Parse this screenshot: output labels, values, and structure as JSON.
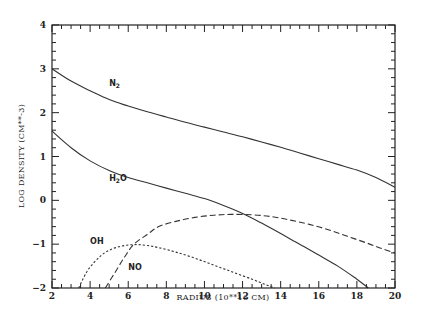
{
  "chart_data": {
    "type": "line",
    "title": "",
    "xlabel": "RADIUS (10**16 CM)",
    "ylabel": "LOG DENSITY (CM**-3)",
    "xlim": [
      2,
      20
    ],
    "ylim": [
      -2,
      4
    ],
    "x_major_ticks": [
      2,
      4,
      6,
      8,
      10,
      12,
      14,
      16,
      18,
      20
    ],
    "x_tick_labels": [
      "2",
      "4",
      "6",
      "8",
      "10",
      "12",
      "14",
      "16",
      "18",
      "20"
    ],
    "x_minor_step": 0.5,
    "y_major_ticks": [
      -2,
      -1,
      0,
      1,
      2,
      3,
      4
    ],
    "y_tick_labels": [
      "-2",
      "-1",
      "0",
      "1",
      "2",
      "3",
      "4"
    ],
    "y_minor_step": 0.2,
    "grid": false,
    "legend": "inline-labels",
    "series": [
      {
        "name": "N2",
        "label": "N",
        "label_sub": "2",
        "label_suffix": "",
        "style": "solid",
        "label_at": [
          5.0,
          2.6
        ],
        "x": [
          2,
          3,
          4,
          5,
          6,
          7,
          8,
          9,
          10,
          11,
          12,
          13,
          14,
          15,
          16,
          17,
          18,
          19,
          20
        ],
        "y": [
          3.0,
          2.72,
          2.5,
          2.3,
          2.15,
          2.02,
          1.9,
          1.78,
          1.67,
          1.56,
          1.45,
          1.33,
          1.21,
          1.08,
          0.95,
          0.82,
          0.69,
          0.52,
          0.3
        ]
      },
      {
        "name": "H2O",
        "label": "H",
        "label_sub": "2",
        "label_suffix": "O",
        "style": "solid",
        "label_at": [
          5.0,
          0.45
        ],
        "x": [
          2,
          3,
          4,
          5,
          6,
          7,
          8,
          9,
          10,
          11,
          12,
          13,
          14,
          15,
          16,
          17,
          18,
          18.6
        ],
        "y": [
          1.58,
          1.2,
          0.9,
          0.68,
          0.52,
          0.4,
          0.28,
          0.16,
          0.04,
          -0.12,
          -0.3,
          -0.52,
          -0.76,
          -1.0,
          -1.25,
          -1.5,
          -1.8,
          -2.0
        ]
      },
      {
        "name": "NO",
        "label": "NO",
        "label_sub": "",
        "label_suffix": "",
        "style": "dashed",
        "label_at": [
          6.0,
          -1.6
        ],
        "x": [
          4.8,
          5.3,
          5.8,
          6.3,
          7.0,
          7.6,
          8.5,
          9.5,
          10.5,
          11.4,
          12.5,
          13.5,
          14.5,
          15.5,
          16.5,
          17.5,
          18.5,
          19.3,
          20
        ],
        "y": [
          -2.0,
          -1.65,
          -1.3,
          -1.0,
          -0.78,
          -0.6,
          -0.48,
          -0.39,
          -0.34,
          -0.32,
          -0.33,
          -0.37,
          -0.45,
          -0.55,
          -0.67,
          -0.82,
          -0.97,
          -1.1,
          -1.2
        ]
      },
      {
        "name": "OH",
        "label": "OH",
        "label_sub": "",
        "label_suffix": "",
        "style": "dotted",
        "label_at": [
          4.0,
          -1.0
        ],
        "x": [
          3.4,
          3.8,
          4.2,
          4.6,
          5.0,
          5.5,
          6.0,
          6.5,
          7.0,
          7.6,
          8.5,
          9.5,
          10.5,
          11.5,
          12.5,
          13.2,
          13.7
        ],
        "y": [
          -2.0,
          -1.65,
          -1.42,
          -1.25,
          -1.14,
          -1.06,
          -1.02,
          -1.01,
          -1.03,
          -1.08,
          -1.18,
          -1.32,
          -1.48,
          -1.64,
          -1.8,
          -1.92,
          -2.0
        ]
      }
    ]
  }
}
